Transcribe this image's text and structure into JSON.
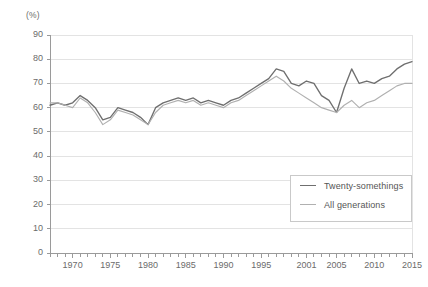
{
  "chart_data": {
    "type": "line",
    "title": "",
    "subtitle": "",
    "xlabel": "",
    "ylabel": "",
    "unit_label": "(%)",
    "ylim": [
      0,
      90
    ],
    "ytick_step": 10,
    "yticks": [
      0,
      10,
      20,
      30,
      40,
      50,
      60,
      70,
      80,
      90
    ],
    "xlim": [
      1967,
      2015
    ],
    "xticks": [
      1970,
      1975,
      1980,
      1985,
      1990,
      1995,
      2001,
      2005,
      2010,
      2015
    ],
    "xtick_labels": [
      "1970",
      "1975",
      "1980",
      "1985",
      "1990",
      "1995",
      "2001",
      "2005",
      "2010",
      "2015"
    ],
    "grid": true,
    "grid_axis": "y",
    "legend_position": "inside-lower-right",
    "minor_ticks": "annual",
    "colors": {
      "twenty_somethings": "#6f6f6f",
      "all_generations": "#b0b0b0",
      "grid": "#e3e3e3",
      "axis": "#9a9a9a",
      "text": "#6b6b6b"
    },
    "series": [
      {
        "name": "Twenty-somethings",
        "color": "#6f6f6f",
        "x": [
          1967,
          1968,
          1969,
          1970,
          1971,
          1972,
          1973,
          1974,
          1975,
          1976,
          1977,
          1978,
          1979,
          1980,
          1981,
          1982,
          1983,
          1984,
          1985,
          1986,
          1987,
          1988,
          1989,
          1990,
          1991,
          1992,
          1993,
          1994,
          1995,
          1996,
          1997,
          1998,
          1999,
          2000,
          2001,
          2002,
          2003,
          2004,
          2005,
          2006,
          2007,
          2008,
          2009,
          2010,
          2011,
          2012,
          2013,
          2014,
          2015
        ],
        "values": [
          61,
          62,
          61,
          62,
          65,
          63,
          60,
          55,
          56,
          60,
          59,
          58,
          56,
          53,
          60,
          62,
          63,
          64,
          63,
          64,
          62,
          63,
          62,
          61,
          63,
          64,
          66,
          68,
          70,
          72,
          76,
          75,
          70,
          69,
          71,
          70,
          65,
          63,
          58,
          68,
          76,
          70,
          71,
          70,
          72,
          73,
          76,
          78,
          79
        ]
      },
      {
        "name": "All generations",
        "color": "#b0b0b0",
        "x": [
          1967,
          1968,
          1969,
          1970,
          1971,
          1972,
          1973,
          1974,
          1975,
          1976,
          1977,
          1978,
          1979,
          1980,
          1981,
          1982,
          1983,
          1984,
          1985,
          1986,
          1987,
          1988,
          1989,
          1990,
          1991,
          1992,
          1993,
          1994,
          1995,
          1996,
          1997,
          1998,
          1999,
          2000,
          2001,
          2002,
          2003,
          2004,
          2005,
          2006,
          2007,
          2008,
          2009,
          2010,
          2011,
          2012,
          2013,
          2014,
          2015
        ],
        "values": [
          62,
          62,
          61,
          60,
          64,
          62,
          58,
          53,
          55,
          59,
          58,
          57,
          55,
          53,
          58,
          61,
          62,
          63,
          62,
          63,
          61,
          62,
          61,
          60,
          62,
          63,
          65,
          67,
          69,
          71,
          73,
          71,
          68,
          66,
          64,
          62,
          60,
          59,
          58,
          61,
          63,
          60,
          62,
          63,
          65,
          67,
          69,
          70,
          70
        ]
      }
    ]
  }
}
